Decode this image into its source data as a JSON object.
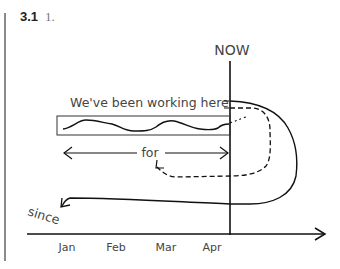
{
  "header": {
    "section_number": "3.1",
    "item_number": "1."
  },
  "diagram": {
    "now_label": "NOW",
    "working_label": "We've been working here",
    "for_label": "for",
    "since_label": "since",
    "months": [
      "Jan",
      "Feb",
      "Mar",
      "Apr"
    ],
    "colors": {
      "line": "#111111",
      "text": "#444444",
      "bar": "#8a8a8a"
    }
  }
}
